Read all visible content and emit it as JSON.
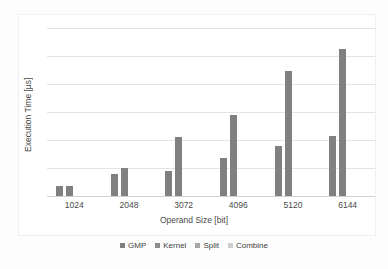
{
  "chart_data": {
    "type": "bar",
    "title": "",
    "xlabel": "Operand Size [bit]",
    "ylabel": "Execution Time [µs]",
    "categories": [
      "1024",
      "2048",
      "3072",
      "4096",
      "5120",
      "6144"
    ],
    "series": [
      {
        "name": "GMP",
        "color": "#808080",
        "values": [
          0.35,
          0.8,
          0.9,
          1.35,
          1.8,
          2.15
        ]
      },
      {
        "name": "Kernel",
        "color": "#808080",
        "values": [
          0.35,
          1.0,
          2.1,
          2.9,
          4.45,
          5.25
        ]
      },
      {
        "name": "Split",
        "color": "#9a9a9a",
        "values": [
          0,
          0,
          0,
          0,
          0,
          0
        ]
      },
      {
        "name": "Combine",
        "color": "#c9c9c9",
        "values": [
          0,
          0,
          0,
          0,
          0,
          0
        ]
      }
    ],
    "ylim": [
      0,
      6
    ],
    "yticks": [
      "0",
      "1",
      "2",
      "3",
      "4",
      "5",
      "6"
    ],
    "grid": true,
    "legend_position": "bottom"
  },
  "legend": {
    "items": [
      {
        "label": "GMP",
        "swatch": "#808080"
      },
      {
        "label": "Kernel",
        "swatch": "#8d8d8d"
      },
      {
        "label": "Split",
        "swatch": "#a8a8a8"
      },
      {
        "label": "Combine",
        "swatch": "#cfcfcf"
      }
    ]
  }
}
